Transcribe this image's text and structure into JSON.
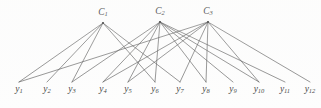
{
  "figure": {
    "type": "bipartite-graph",
    "width": 321,
    "height": 108,
    "background_color": "#fdfdfd",
    "edge_color": "#4a4a4a",
    "node_color": "#2e2e2e",
    "label_color": "#2b2b2b"
  },
  "cluster_nodes": [
    {
      "id": "C1",
      "label_base": "C",
      "label_sub": "1",
      "x": 103,
      "y": 20
    },
    {
      "id": "C2",
      "label_base": "C",
      "label_sub": "2",
      "x": 160,
      "y": 19
    },
    {
      "id": "C3",
      "label_base": "C",
      "label_sub": "3",
      "x": 208,
      "y": 19
    }
  ],
  "leaf_nodes": [
    {
      "id": "y1",
      "label_base": "y",
      "label_sub": "1",
      "x": 19,
      "y": 88
    },
    {
      "id": "y2",
      "label_base": "y",
      "label_sub": "2",
      "x": 47,
      "y": 88
    },
    {
      "id": "y3",
      "label_base": "y",
      "label_sub": "3",
      "x": 72,
      "y": 88
    },
    {
      "id": "y4",
      "label_base": "y",
      "label_sub": "4",
      "x": 103,
      "y": 88
    },
    {
      "id": "y5",
      "label_base": "y",
      "label_sub": "5",
      "x": 128,
      "y": 88
    },
    {
      "id": "y6",
      "label_base": "y",
      "label_sub": "6",
      "x": 155,
      "y": 88
    },
    {
      "id": "y7",
      "label_base": "y",
      "label_sub": "7",
      "x": 180,
      "y": 88
    },
    {
      "id": "y8",
      "label_base": "y",
      "label_sub": "8",
      "x": 206,
      "y": 88
    },
    {
      "id": "y9",
      "label_base": "y",
      "label_sub": "9",
      "x": 233,
      "y": 88
    },
    {
      "id": "y10",
      "label_base": "y",
      "label_sub": "10",
      "x": 259,
      "y": 88
    },
    {
      "id": "y11",
      "label_base": "y",
      "label_sub": "11",
      "x": 285,
      "y": 88
    },
    {
      "id": "y12",
      "label_base": "y",
      "label_sub": "12",
      "x": 310,
      "y": 88
    }
  ],
  "edges": [
    {
      "from": "C1",
      "to": "y1"
    },
    {
      "from": "C1",
      "to": "y2"
    },
    {
      "from": "C1",
      "to": "y3"
    },
    {
      "from": "C1",
      "to": "y6"
    },
    {
      "from": "C1",
      "to": "y7"
    },
    {
      "from": "C2",
      "to": "y3"
    },
    {
      "from": "C2",
      "to": "y4"
    },
    {
      "from": "C2",
      "to": "y5"
    },
    {
      "from": "C2",
      "to": "y6"
    },
    {
      "from": "C2",
      "to": "y8"
    },
    {
      "from": "C2",
      "to": "y9"
    },
    {
      "from": "C2",
      "to": "y10"
    },
    {
      "from": "C2",
      "to": "y11"
    },
    {
      "from": "C3",
      "to": "y1"
    },
    {
      "from": "C3",
      "to": "y4"
    },
    {
      "from": "C3",
      "to": "y5"
    },
    {
      "from": "C3",
      "to": "y7"
    },
    {
      "from": "C3",
      "to": "y8"
    },
    {
      "from": "C3",
      "to": "y10"
    },
    {
      "from": "C3",
      "to": "y12"
    }
  ]
}
